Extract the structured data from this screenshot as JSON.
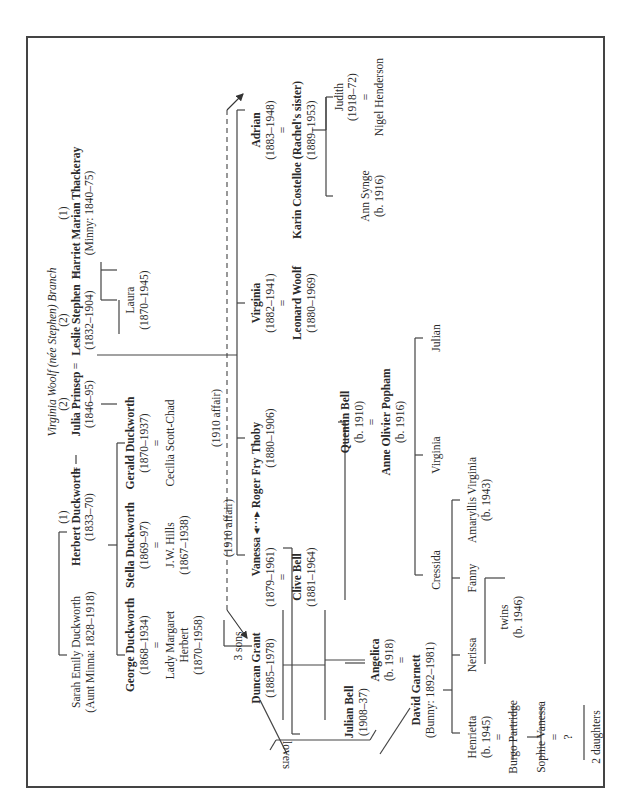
{
  "title": "Virginia Woolf (née Stephen) Branch",
  "labels": [
    {
      "id": "title",
      "t": "Virginia Woolf (née Stephen) Branch",
      "x": 52,
      "y": 352,
      "s": "i"
    },
    {
      "id": "harriet-num",
      "t": "(1)",
      "x": 63,
      "y": 213
    },
    {
      "id": "harriet-name",
      "t": "Harriet Marian Thackeray",
      "x": 76,
      "y": 213,
      "s": "b"
    },
    {
      "id": "harriet-dates",
      "t": "(Minny: 1840–75)",
      "x": 89,
      "y": 213
    },
    {
      "id": "eq-harriet-leslie",
      "t": "=",
      "x": 76,
      "y": 275
    },
    {
      "id": "leslie-num",
      "t": "(2)",
      "x": 63,
      "y": 320
    },
    {
      "id": "leslie-name",
      "t": "Leslie Stephen",
      "x": 76,
      "y": 320,
      "s": "b"
    },
    {
      "id": "leslie-dates",
      "t": "(1832–1904)",
      "x": 89,
      "y": 320
    },
    {
      "id": "eq-leslie-julia",
      "t": "=",
      "x": 76,
      "y": 366
    },
    {
      "id": "julia-num",
      "t": "(2)",
      "x": 63,
      "y": 404
    },
    {
      "id": "julia-name",
      "t": "Julia Prinsep",
      "x": 76,
      "y": 404,
      "s": "b"
    },
    {
      "id": "julia-dates",
      "t": "(1846–95)",
      "x": 89,
      "y": 404
    },
    {
      "id": "eq-julia-herbert",
      "t": "=",
      "x": 76,
      "y": 470
    },
    {
      "id": "herbert-num",
      "t": "(1)",
      "x": 63,
      "y": 517
    },
    {
      "id": "herbert-name",
      "t": "Herbert Duckworth",
      "x": 76,
      "y": 517,
      "s": "b"
    },
    {
      "id": "herbert-dates",
      "t": "(1833–70)",
      "x": 89,
      "y": 517
    },
    {
      "id": "sarah-name",
      "t": "Sarah Emily Duckworth",
      "x": 76,
      "y": 652
    },
    {
      "id": "sarah-dates",
      "t": "(Aunt Minna: 1828–1918)",
      "x": 90,
      "y": 652
    },
    {
      "id": "laura-name",
      "t": "Laura",
      "x": 130,
      "y": 300
    },
    {
      "id": "laura-dates",
      "t": "(1870–1945)",
      "x": 144,
      "y": 300
    },
    {
      "id": "gerald-name",
      "t": "Gerald Duckworth",
      "x": 130,
      "y": 443,
      "s": "b"
    },
    {
      "id": "gerald-dates",
      "t": "(1870–1937)",
      "x": 144,
      "y": 443
    },
    {
      "id": "eq-gerald",
      "t": "=",
      "x": 157,
      "y": 443
    },
    {
      "id": "cecilia-name",
      "t": "Cecilia Scott-Chad",
      "x": 170,
      "y": 443
    },
    {
      "id": "stella-name",
      "t": "Stella Duckworth",
      "x": 130,
      "y": 545,
      "s": "b"
    },
    {
      "id": "stella-dates",
      "t": "(1869–97)",
      "x": 144,
      "y": 545
    },
    {
      "id": "eq-stella",
      "t": "=",
      "x": 157,
      "y": 545
    },
    {
      "id": "jwhills-name",
      "t": "J.W. Hills",
      "x": 170,
      "y": 545
    },
    {
      "id": "jwhills-dates",
      "t": "(1867–1938)",
      "x": 184,
      "y": 545
    },
    {
      "id": "george-name",
      "t": "George Duckworth",
      "x": 130,
      "y": 645,
      "s": "b"
    },
    {
      "id": "george-dates",
      "t": "(1868–1934)",
      "x": 144,
      "y": 645
    },
    {
      "id": "eq-george",
      "t": "=",
      "x": 157,
      "y": 645
    },
    {
      "id": "margaret-name1",
      "t": "Lady Margaret",
      "x": 170,
      "y": 645
    },
    {
      "id": "margaret-name2",
      "t": "Herbert",
      "x": 184,
      "y": 645
    },
    {
      "id": "margaret-dates",
      "t": "(1870–1958)",
      "x": 198,
      "y": 645
    },
    {
      "id": "three-sons",
      "t": "3 sons",
      "x": 238,
      "y": 646
    },
    {
      "id": "affair-label-1",
      "t": "(1910 affair)",
      "x": 216,
      "y": 418
    },
    {
      "id": "affair-label-2",
      "t": "(1910 affair)",
      "x": 228,
      "y": 528
    },
    {
      "id": "adrian-name",
      "t": "Adrian",
      "x": 256,
      "y": 130,
      "s": "b"
    },
    {
      "id": "adrian-dates",
      "t": "(1883–1948)",
      "x": 270,
      "y": 130
    },
    {
      "id": "eq-adrian",
      "t": "=",
      "x": 283,
      "y": 130
    },
    {
      "id": "karin-name",
      "t": "Karin Costelloe (Rachel's sister)",
      "x": 297,
      "y": 160,
      "s": "b"
    },
    {
      "id": "karin-dates",
      "t": "(1889–1953)",
      "x": 311,
      "y": 130
    },
    {
      "id": "judith-name",
      "t": "Judith",
      "x": 339,
      "y": 97
    },
    {
      "id": "judith-dates",
      "t": "(1918–72)",
      "x": 352,
      "y": 97
    },
    {
      "id": "eq-judith",
      "t": "=",
      "x": 366,
      "y": 97
    },
    {
      "id": "nigel-name",
      "t": "Nigel Henderson",
      "x": 379,
      "y": 97
    },
    {
      "id": "ann-name",
      "t": "Ann Synge",
      "x": 365,
      "y": 196
    },
    {
      "id": "ann-dates",
      "t": "(b. 1916)",
      "x": 379,
      "y": 196
    },
    {
      "id": "virginia-name",
      "t": "Virginia",
      "x": 256,
      "y": 303,
      "s": "b"
    },
    {
      "id": "virginia-dates",
      "t": "(1882–1941)",
      "x": 270,
      "y": 303
    },
    {
      "id": "eq-virginia",
      "t": "=",
      "x": 283,
      "y": 303
    },
    {
      "id": "leonard-name",
      "t": "Leonard Woolf",
      "x": 297,
      "y": 303,
      "s": "b"
    },
    {
      "id": "leonard-dates",
      "t": "(1880–1969)",
      "x": 311,
      "y": 303
    },
    {
      "id": "thoby-name",
      "t": "Thoby",
      "x": 256,
      "y": 438,
      "s": "b"
    },
    {
      "id": "thoby-dates",
      "t": "(1880–1906)",
      "x": 270,
      "y": 438
    },
    {
      "id": "vanessa-name",
      "t": "Vanessa ◂···▸ Roger Fry",
      "x": 256,
      "y": 517,
      "s": "b"
    },
    {
      "id": "vanessa-dates",
      "t": "(1879–1961)",
      "x": 270,
      "y": 577
    },
    {
      "id": "eq-vanessa",
      "t": "=",
      "x": 283,
      "y": 577
    },
    {
      "id": "clive-name",
      "t": "Clive Bell",
      "x": 297,
      "y": 577,
      "s": "b"
    },
    {
      "id": "clive-dates",
      "t": "(1881–1964)",
      "x": 311,
      "y": 577
    },
    {
      "id": "duncan-name",
      "t": "Duncan Grant",
      "x": 256,
      "y": 668,
      "s": "b"
    },
    {
      "id": "duncan-dates",
      "t": "(1885–1978)",
      "x": 270,
      "y": 668
    },
    {
      "id": "quentin-name",
      "t": "Quentin Bell",
      "x": 345,
      "y": 422,
      "s": "b"
    },
    {
      "id": "quentin-dates",
      "t": "(b. 1910)",
      "x": 359,
      "y": 422
    },
    {
      "id": "eq-quentin",
      "t": "=",
      "x": 372,
      "y": 422
    },
    {
      "id": "anne-name",
      "t": "Anne Olivier Popham",
      "x": 386,
      "y": 422,
      "s": "b"
    },
    {
      "id": "anne-dates",
      "t": "(b. 1916)",
      "x": 400,
      "y": 422
    },
    {
      "id": "julian-q-name",
      "t": "Julian",
      "x": 436,
      "y": 338
    },
    {
      "id": "virginia-q-name",
      "t": "Virginia",
      "x": 436,
      "y": 455
    },
    {
      "id": "cressida-name",
      "t": "Cressida",
      "x": 436,
      "y": 570
    },
    {
      "id": "angelica-name",
      "t": "Angelica",
      "x": 375,
      "y": 660,
      "s": "b"
    },
    {
      "id": "angelica-dates",
      "t": "(b. 1918)",
      "x": 389,
      "y": 660
    },
    {
      "id": "eq-angelica",
      "t": "=",
      "x": 402,
      "y": 660
    },
    {
      "id": "garnett-name",
      "t": "David Garnett",
      "x": 416,
      "y": 690,
      "s": "b"
    },
    {
      "id": "garnett-dates",
      "t": "(Bunny: 1892–1981)",
      "x": 430,
      "y": 690
    },
    {
      "id": "julianbell-name",
      "t": "Julian Bell",
      "x": 349,
      "y": 712,
      "s": "b"
    },
    {
      "id": "julianbell-dates",
      "t": "(1908–37)",
      "x": 363,
      "y": 712
    },
    {
      "id": "amaryllis-name",
      "t": "Amaryllis Virginia",
      "x": 472,
      "y": 500
    },
    {
      "id": "amaryllis-dates",
      "t": "(b. 1943)",
      "x": 486,
      "y": 500
    },
    {
      "id": "fanny-name",
      "t": "Fanny",
      "x": 472,
      "y": 578
    },
    {
      "id": "nerissa-name",
      "t": "Nerissa",
      "x": 472,
      "y": 655
    },
    {
      "id": "twins-label",
      "t": "twins",
      "x": 504,
      "y": 617
    },
    {
      "id": "twins-dates",
      "t": "(b. 1946)",
      "x": 518,
      "y": 617
    },
    {
      "id": "henrietta-name",
      "t": "Henrietta",
      "x": 472,
      "y": 737
    },
    {
      "id": "henrietta-dates",
      "t": "(b. 1945)",
      "x": 486,
      "y": 737
    },
    {
      "id": "eq-henrietta",
      "t": "=",
      "x": 499,
      "y": 737
    },
    {
      "id": "burgo-name",
      "t": "Burgo Partridge",
      "x": 513,
      "y": 737
    },
    {
      "id": "sophie-name",
      "t": "Sophie Vanessa",
      "x": 541,
      "y": 737
    },
    {
      "id": "eq-sophie",
      "t": "=",
      "x": 555,
      "y": 737
    },
    {
      "id": "unknown-spouse",
      "t": "?",
      "x": 568,
      "y": 737
    },
    {
      "id": "two-daughters",
      "t": "2 daughters",
      "x": 596,
      "y": 737
    },
    {
      "id": "lovers-label",
      "t": "lovers",
      "x": 286,
      "y": 755,
      "s": "flip"
    }
  ],
  "lines": [
    [
      59,
      532,
      59,
      655
    ],
    [
      59,
      532,
      67,
      532
    ],
    [
      59,
      655,
      67,
      655
    ],
    [
      76,
      455,
      76,
      464
    ],
    [
      101,
      300,
      101,
      262
    ],
    [
      101,
      300,
      117,
      300
    ],
    [
      101,
      270,
      117,
      270
    ],
    [
      101,
      404,
      117,
      404
    ],
    [
      117,
      443,
      117,
      655
    ],
    [
      108,
      545,
      117,
      545
    ],
    [
      117,
      443,
      125,
      443
    ],
    [
      117,
      655,
      125,
      655
    ],
    [
      119,
      300,
      119,
      334
    ],
    [
      155,
      237,
      155,
      237
    ],
    [
      237,
      110,
      237,
      555
    ],
    [
      237,
      110,
      245,
      110
    ],
    [
      237,
      303,
      245,
      303
    ],
    [
      237,
      438,
      245,
      438
    ],
    [
      237,
      555,
      245,
      555
    ],
    [
      97,
      355,
      237,
      355
    ],
    [
      224,
      646,
      224,
      620
    ],
    [
      224,
      646,
      252,
      646
    ],
    [
      283,
      610,
      283,
      720
    ],
    [
      283,
      665,
      283,
      665
    ],
    [
      326,
      130,
      312,
      130
    ],
    [
      326,
      130,
      326,
      97
    ],
    [
      326,
      97,
      326,
      196
    ],
    [
      326,
      97,
      333,
      97
    ],
    [
      326,
      196,
      333,
      196
    ],
    [
      292,
      548,
      292,
      734
    ],
    [
      292,
      548,
      283,
      548
    ],
    [
      325,
      610,
      325,
      720
    ],
    [
      283,
      665,
      325,
      665
    ],
    [
      292,
      734,
      300,
      734
    ],
    [
      325,
      660,
      365,
      660
    ],
    [
      345,
      663,
      365,
      663
    ],
    [
      415,
      338,
      415,
      575
    ],
    [
      415,
      338,
      423,
      338
    ],
    [
      415,
      455,
      423,
      455
    ],
    [
      415,
      575,
      423,
      575
    ],
    [
      345,
      600,
      345,
      422
    ],
    [
      338,
      422,
      345,
      422
    ],
    [
      443,
      690,
      452,
      690
    ],
    [
      452,
      500,
      452,
      733
    ],
    [
      452,
      500,
      460,
      500
    ],
    [
      452,
      578,
      460,
      578
    ],
    [
      452,
      655,
      460,
      655
    ],
    [
      452,
      733,
      460,
      733
    ],
    [
      485,
      578,
      505,
      578
    ],
    [
      485,
      578,
      485,
      664
    ],
    [
      513,
      705,
      513,
      760
    ],
    [
      541,
      705,
      541,
      760
    ],
    [
      527,
      737,
      541,
      737
    ],
    [
      584,
      705,
      584,
      760
    ],
    [
      276,
      740,
      370,
      740
    ],
    [
      276,
      740,
      270,
      750
    ],
    [
      370,
      740,
      376,
      730
    ]
  ],
  "diagonals": [
    [
      287,
      754,
      260,
      700
    ],
    [
      410,
      708,
      380,
      754
    ]
  ],
  "dashed": [
    [
      227,
      110,
      227,
      610
    ]
  ],
  "arrows": [
    [
      227,
      610,
      247,
      638
    ],
    [
      227,
      110,
      243,
      94
    ]
  ]
}
